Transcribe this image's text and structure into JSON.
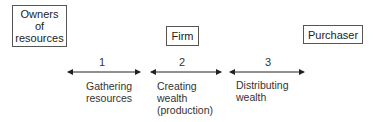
{
  "nodes": {
    "owners": {
      "label_lines": [
        "Owners",
        "of",
        "resources"
      ]
    },
    "firm": {
      "label": "Firm"
    },
    "purchaser": {
      "label": "Purchaser"
    }
  },
  "stages": [
    {
      "number": "1",
      "label_lines": [
        "Gathering",
        "resources"
      ]
    },
    {
      "number": "2",
      "label_lines": [
        "Creating",
        "wealth",
        "(production)"
      ]
    },
    {
      "number": "3",
      "label_lines": [
        "Distributing",
        "wealth"
      ]
    }
  ]
}
